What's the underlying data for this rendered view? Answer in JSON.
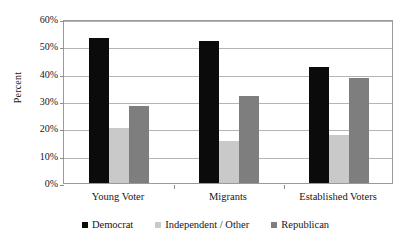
{
  "chart_data": {
    "type": "bar",
    "title": "",
    "xlabel": "",
    "ylabel": "Percent",
    "ylim": [
      0,
      60
    ],
    "ytick_labels": [
      "60%",
      "50%",
      "40%",
      "30%",
      "20%",
      "10%",
      "0%"
    ],
    "ytick_values": [
      60,
      50,
      40,
      30,
      20,
      10,
      0
    ],
    "grid": true,
    "legend_position": "bottom",
    "categories": [
      "Young Voter",
      "Migrants",
      "Established Voters"
    ],
    "series": [
      {
        "name": "Democrat",
        "color": "#0b0b0b",
        "values": [
          53,
          52,
          42.5
        ]
      },
      {
        "name": "Independent / Other",
        "color": "#c9c9c9",
        "values": [
          20,
          15.5,
          17.5
        ]
      },
      {
        "name": "Republican",
        "color": "#7e7e7e",
        "values": [
          28,
          32,
          38.5
        ]
      }
    ]
  },
  "axis": {
    "y_title": "Percent"
  },
  "legend": {
    "items": [
      {
        "label": "Democrat",
        "swatch": "democrat"
      },
      {
        "label": "Independent / Other",
        "swatch": "independent"
      },
      {
        "label": "Republican",
        "swatch": "republican"
      }
    ]
  }
}
